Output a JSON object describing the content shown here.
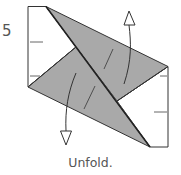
{
  "step": {
    "number": "5"
  },
  "caption": "Unfold.",
  "colors": {
    "paper_white": "#ffffff",
    "paper_colored": "#a9a9a9",
    "line": "#333333",
    "crease": "#555555"
  },
  "diagram": {
    "type": "origami-step",
    "elements": [
      "white-square-outline",
      "upper-gray-flap",
      "lower-gray-flap",
      "center-diagonal-crease",
      "unfold-arrow-up",
      "unfold-arrow-down",
      "edge-tick-marks"
    ]
  }
}
